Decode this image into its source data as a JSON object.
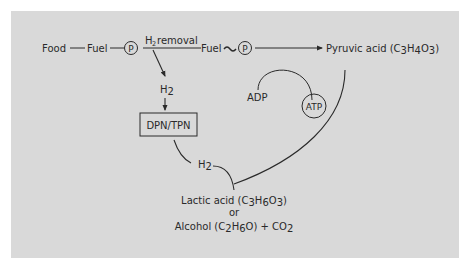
{
  "diagram": {
    "type": "metabolic-pathway",
    "colors": {
      "panel": "#d9d9d9",
      "ink": "#2a2a2a",
      "page": "#ffffff"
    },
    "top_chain": {
      "food": "Food",
      "fuel1": "Fuel",
      "phosphate1": "P",
      "h2_removal_prefix": "H",
      "h2_removal_sub": "2",
      "h2_removal_suffix": " removal",
      "fuel2": "Fuel",
      "high_energy_bond": "~",
      "phosphate2": "P",
      "pyruvic_label": "Pyruvic acid (C",
      "pyruvic_sub1": "3",
      "pyruvic_h": "H",
      "pyruvic_sub2": "4",
      "pyruvic_o": "O",
      "pyruvic_sub3": "3",
      "pyruvic_close": ")"
    },
    "hydrogen_branch": {
      "h2_label": "H",
      "h2_sub": "2",
      "carrier_box": "DPN/TPN",
      "h2_return_label": "H",
      "h2_return_sub": "2"
    },
    "atp_cycle": {
      "adp": "ADP",
      "atp": "ATP"
    },
    "products": {
      "lactic_label": "Lactic acid (C",
      "lactic_sub1": "3",
      "lactic_h": "H",
      "lactic_sub2": "6",
      "lactic_o": "O",
      "lactic_sub3": "3",
      "lactic_close": ")",
      "or": "or",
      "alcohol_label": "Alcohol (C",
      "alcohol_sub1": "2",
      "alcohol_h": "H",
      "alcohol_sub2": "6",
      "alcohol_o": "O) + CO",
      "alcohol_sub3": "2"
    }
  }
}
